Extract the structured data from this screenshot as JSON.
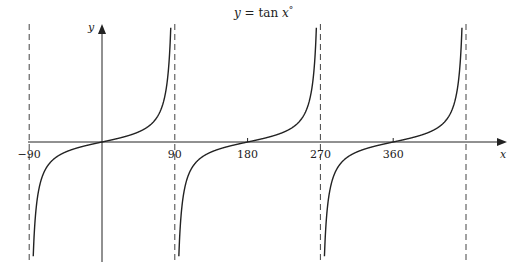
{
  "chart_data": {
    "type": "line",
    "title": "y = tan x°",
    "title_parts": {
      "lhs": "y",
      "eq": " = tan ",
      "var": "x",
      "deg": "°"
    },
    "xlabel": "x",
    "ylabel": "y",
    "xlim": [
      -90,
      470
    ],
    "x_ticks": [
      {
        "value": -90,
        "label": "−90"
      },
      {
        "value": 90,
        "label": "90"
      },
      {
        "value": 180,
        "label": "180"
      },
      {
        "value": 270,
        "label": "270"
      },
      {
        "value": 360,
        "label": "360"
      }
    ],
    "asymptotes": [
      -90,
      90,
      270,
      450
    ],
    "series": [
      {
        "name": "tan x branch 1",
        "x_range": [
          -88,
          88
        ]
      },
      {
        "name": "tan x branch 2",
        "x_range": [
          92,
          268
        ]
      },
      {
        "name": "tan x branch 3",
        "x_range": [
          272,
          448
        ]
      }
    ],
    "grid": false,
    "legend": "none",
    "colors": {
      "curve": "#222222",
      "axis": "#222222",
      "asymptote": "#444444"
    }
  }
}
